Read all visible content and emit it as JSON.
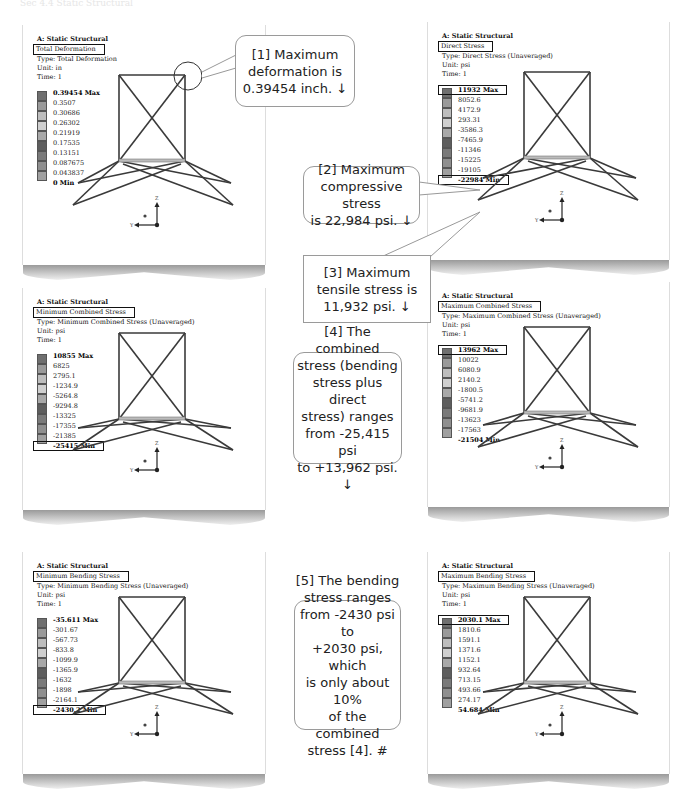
{
  "header": {
    "faded_title": "Sec 4.4 Static Structural"
  },
  "panels": [
    {
      "id": "total-deformation",
      "title": "A: Static Structural",
      "result_name": "Total Deformation",
      "type": "Type: Total Deformation",
      "unit": "Unit: in",
      "time": "Time: 1",
      "scale": [
        "0.39454 Max",
        "0.3507",
        "0.30686",
        "0.26302",
        "0.21919",
        "0.17535",
        "0.13151",
        "0.087675",
        "0.043837",
        "0 Min"
      ],
      "boxed_labels": []
    },
    {
      "id": "direct-stress",
      "title": "A: Static Structural",
      "result_name": "Direct Stress",
      "type": "Type: Direct Stress (Unaveraged)",
      "unit": "Unit: psi",
      "time": "Time: 1",
      "scale": [
        "11932 Max",
        "8052.6",
        "4172.9",
        "293.31",
        "-3586.3",
        "-7465.9",
        "-11346",
        "-15225",
        "-19105",
        "-22984 Min"
      ],
      "boxed_labels": [
        "max",
        "min"
      ]
    },
    {
      "id": "minimum-combined-stress",
      "title": "A: Static Structural",
      "result_name": "Minimum Combined Stress",
      "type": "Type: Minimum Combined Stress (Unaveraged)",
      "unit": "Unit: psi",
      "time": "Time: 1",
      "scale": [
        "10855 Max",
        "6825",
        "2795.1",
        "-1234.9",
        "-5264.8",
        "-9294.8",
        "-13325",
        "-17355",
        "-21385",
        "-25415 Min"
      ],
      "boxed_labels": [
        "min"
      ]
    },
    {
      "id": "maximum-combined-stress",
      "title": "A: Static Structural",
      "result_name": "Maximum Combined Stress",
      "type": "Type: Maximum Combined Stress (Unaveraged)",
      "unit": "Unit: psi",
      "time": "Time: 1",
      "scale": [
        "13962 Max",
        "10022",
        "6080.9",
        "2140.2",
        "-1800.5",
        "-5741.2",
        "-9681.9",
        "-13623",
        "-17563",
        "-21504 Min"
      ],
      "boxed_labels": [
        "max"
      ]
    },
    {
      "id": "minimum-bending-stress",
      "title": "A: Static Structural",
      "result_name": "Minimum Bending Stress",
      "type": "Type: Minimum Bending Stress (Unaveraged)",
      "unit": "Unit: psi",
      "time": "Time: 1",
      "scale": [
        "-35.611 Max",
        "-301.67",
        "-567.73",
        "-833.8",
        "-1099.9",
        "-1365.9",
        "-1632",
        "-1898",
        "-2164.1",
        "-2430.2 Min"
      ],
      "boxed_labels": [
        "min"
      ]
    },
    {
      "id": "maximum-bending-stress",
      "title": "A: Static Structural",
      "result_name": "Maximum Bending Stress",
      "type": "Type: Maximum Bending Stress (Unaveraged)",
      "unit": "Unit: psi",
      "time": "Time: 1",
      "scale": [
        "2030.1 Max",
        "1810.6",
        "1591.1",
        "1371.6",
        "1152.1",
        "932.64",
        "713.15",
        "493.66",
        "274.17",
        "54.684 Min"
      ],
      "boxed_labels": [
        "max"
      ]
    }
  ],
  "scale_colors": [
    "#6f6f6f",
    "#9a9a9a",
    "#bdbdbd",
    "#cfcfcf",
    "#a8a8a8",
    "#5e5e5e",
    "#7a7a7a",
    "#8f8f8f",
    "#a0a0a0",
    "#3e3e3e"
  ],
  "triad": {
    "z": "Z",
    "y": "Y"
  },
  "callouts": {
    "c1": [
      "[1] Maximum",
      "deformation is",
      "0.39454 inch. ↓"
    ],
    "c2": [
      "[2] Maximum",
      "compressive stress",
      "is 22,984 psi. ↓"
    ],
    "c3": [
      "[3] Maximum",
      "tensile stress is",
      "11,932 psi. ↓"
    ],
    "c4": [
      "[4] The combined",
      "stress (bending",
      "stress plus direct",
      "stress) ranges",
      "from -25,415 psi",
      "to +13,962 psi. ↓"
    ],
    "c5": [
      "[5] The bending",
      "stress ranges",
      "from -2430 psi to",
      "+2030 psi, which",
      "is only about 10%",
      "of the combined",
      "stress [4]. #"
    ]
  }
}
